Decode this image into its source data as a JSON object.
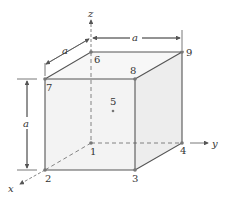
{
  "diagram": {
    "colors": {
      "line": "#555555",
      "face": "#f3f3f3",
      "node": "#777777",
      "text": "#333333"
    },
    "axes": {
      "x": "x",
      "y": "y",
      "z": "z"
    },
    "dimensions": {
      "depth": "a",
      "width": "a",
      "height": "a"
    },
    "nodes": [
      {
        "id": "1",
        "label": "1"
      },
      {
        "id": "2",
        "label": "2"
      },
      {
        "id": "3",
        "label": "3"
      },
      {
        "id": "4",
        "label": "4"
      },
      {
        "id": "5",
        "label": "5"
      },
      {
        "id": "6",
        "label": "6"
      },
      {
        "id": "7",
        "label": "7"
      },
      {
        "id": "8",
        "label": "8"
      },
      {
        "id": "9",
        "label": "9"
      }
    ]
  }
}
